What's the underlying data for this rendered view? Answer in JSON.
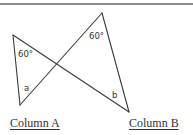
{
  "figure": {
    "line_color": "#3a3a3a",
    "segments": [
      {
        "name": "left-triangle-left-side",
        "x1": 13,
        "y1": 35,
        "x2": 20,
        "y2": 105
      },
      {
        "name": "long-diagonal-down",
        "x1": 13,
        "y1": 35,
        "x2": 129,
        "y2": 112
      },
      {
        "name": "long-diagonal-up",
        "x1": 20,
        "y1": 105,
        "x2": 102,
        "y2": 13
      },
      {
        "name": "right-triangle-right-side",
        "x1": 102,
        "y1": 13,
        "x2": 129,
        "y2": 112
      }
    ],
    "labels": {
      "left_angle": "60°",
      "top_angle": "60°",
      "a": "a",
      "b": "b"
    }
  },
  "columns": {
    "a": "Column A",
    "b": "Column B"
  }
}
